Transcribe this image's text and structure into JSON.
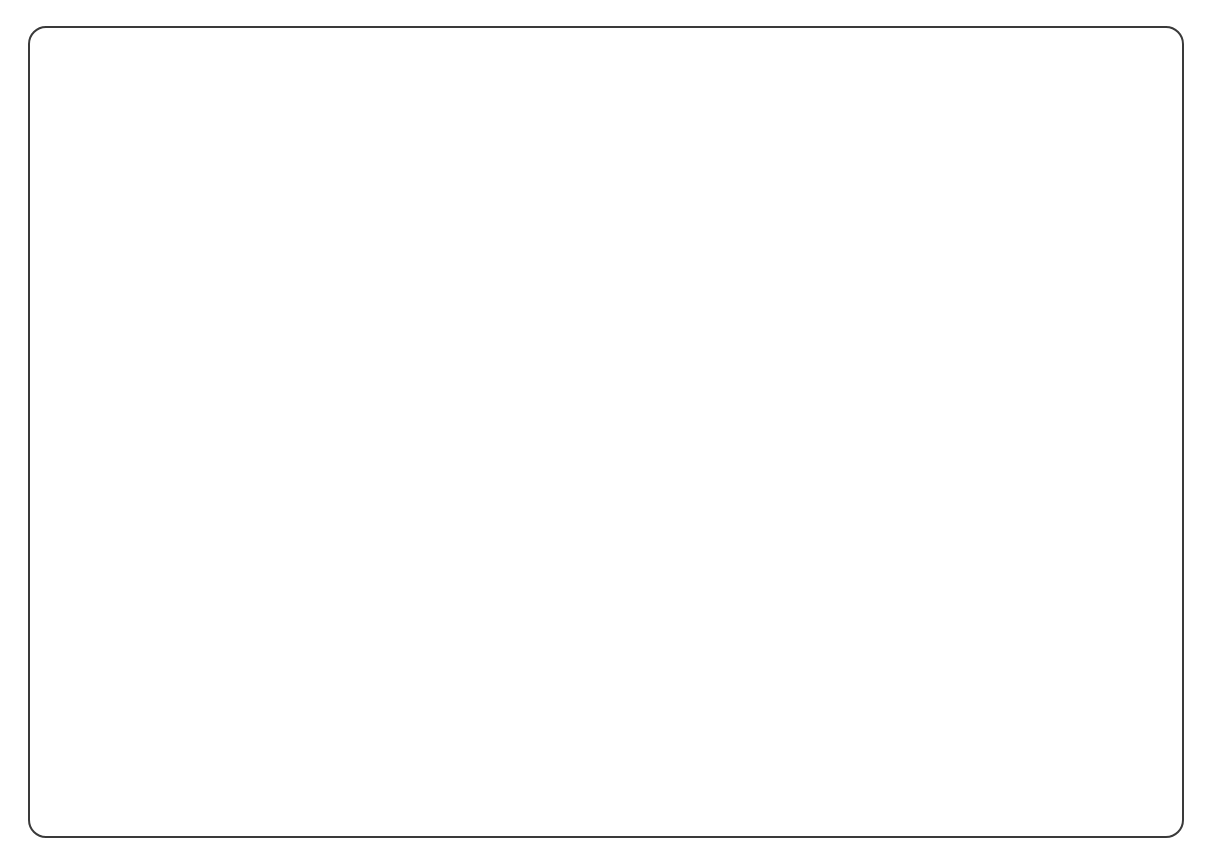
{
  "title": {
    "line1": "HOUSE VOTE ON PROHIBITION",
    "line2": "The 18th Amendment • 1917"
  },
  "legend": {
    "for_label": "States for prohibition",
    "against_label": "States against prohibition",
    "split_label": "States split",
    "colors": {
      "for": "#d2d1cb",
      "against": "#9b9b97",
      "split": "#c0bfba",
      "water": "#ffffff",
      "border": "#3a3a3a"
    }
  },
  "keys": {
    "for_prohibition_label": "For prohibition:",
    "for_prohibition_value": "2F",
    "against_prohibition_label": "Against prohibition:",
    "against_prohibition_value": "2A",
    "not_voting_label": "Not voting:",
    "not_voting_value": "2"
  },
  "totals": {
    "row_label": "Totals:",
    "headers": [
      "For",
      "Against",
      "Not Voting"
    ],
    "values": [
      "289",
      "134",
      "12"
    ]
  },
  "states": [
    {
      "id": "washington",
      "name": "WASHINGTON",
      "for": "5F",
      "against": "",
      "notvoting": "",
      "shade": "for"
    },
    {
      "id": "oregon",
      "name": "OREGON",
      "for": "2F",
      "against": "1A",
      "notvoting": "",
      "shade": "split"
    },
    {
      "id": "california",
      "name": "CALIFORNIA",
      "for": "5F",
      "against": "5A",
      "notvoting": "1",
      "shade": "split"
    },
    {
      "id": "nevada",
      "name": "NEVADA",
      "for": "",
      "against": "1A",
      "notvoting": "",
      "shade": "against"
    },
    {
      "id": "idaho",
      "name": "IDAHO",
      "for": "2F",
      "against": "",
      "notvoting": "",
      "shade": "for"
    },
    {
      "id": "montana",
      "name": "MONTANA",
      "for": "2F",
      "against": "",
      "notvoting": "",
      "shade": "for"
    },
    {
      "id": "wyoming",
      "name": "WYOMING",
      "for": "1F",
      "against": "",
      "notvoting": "",
      "shade": "for"
    },
    {
      "id": "utah",
      "name": "UTAH",
      "for": "2F",
      "against": "",
      "notvoting": "",
      "shade": "for"
    },
    {
      "id": "colorado",
      "name": "COLORADO",
      "for": "4F",
      "against": "",
      "notvoting": "",
      "shade": "for"
    },
    {
      "id": "arizona",
      "name": "ARIZONA",
      "for": "1F",
      "against": "",
      "notvoting": "",
      "shade": "for"
    },
    {
      "id": "new-mexico",
      "name": "NEW MEXICO",
      "for": "1F",
      "against": "",
      "notvoting": "",
      "shade": "for"
    },
    {
      "id": "north-dakota",
      "name": "NORTH DAKOTA",
      "for": "3F",
      "against": "",
      "notvoting": "",
      "shade": "for"
    },
    {
      "id": "south-dakota",
      "name": "SOUTH DAKOTA",
      "for": "3F",
      "against": "",
      "notvoting": "",
      "shade": "for"
    },
    {
      "id": "nebraska",
      "name": "NEBRASKA",
      "for": "6F",
      "against": "",
      "notvoting": "",
      "shade": "for"
    },
    {
      "id": "kansas",
      "name": "KANSAS",
      "for": "8F",
      "against": "",
      "notvoting": "",
      "shade": "for"
    },
    {
      "id": "oklahoma",
      "name": "OKLAHOMA",
      "for": "8F",
      "against": "",
      "notvoting": "",
      "shade": "for"
    },
    {
      "id": "texas",
      "name": "TEXAS",
      "for": "8F",
      "against": "8A",
      "notvoting": "2",
      "shade": "split"
    },
    {
      "id": "minnesota",
      "name": "MINN.",
      "for": "8F",
      "against": "2A",
      "notvoting": "",
      "shade": "split"
    },
    {
      "id": "iowa",
      "name": "IOWA",
      "for": "10F",
      "against": "1A",
      "notvoting": "",
      "shade": "split"
    },
    {
      "id": "missouri",
      "name": "MISSOURI",
      "for": "12F",
      "against": "3A",
      "notvoting": "1",
      "shade": "split"
    },
    {
      "id": "arkansas",
      "name": "ARKANSAS",
      "for": "7F",
      "against": "",
      "notvoting": "",
      "shade": "for"
    },
    {
      "id": "louisiana",
      "name": "LOUISIANA",
      "for": "4F",
      "against": "4A",
      "notvoting": "",
      "shade": "split"
    },
    {
      "id": "wisconsin",
      "name": "WISCONSIN",
      "for": "6F",
      "against": "5A",
      "notvoting": "",
      "shade": "split"
    },
    {
      "id": "illinois",
      "name": "ILLINOIS",
      "for": "17F",
      "against": "7A",
      "notvoting": "3",
      "shade": "split"
    },
    {
      "id": "michigan",
      "name": "MICHIGAN",
      "for": "11F",
      "against": "2A",
      "notvoting": "",
      "shade": "split"
    },
    {
      "id": "indiana",
      "name": "IND.",
      "for": "10F",
      "against": "",
      "notvoting": "",
      "shade": "for"
    },
    {
      "id": "ohio",
      "name": "OHIO",
      "for": "12F",
      "against": "8A",
      "notvoting": "2",
      "shade": "split"
    },
    {
      "id": "kentucky",
      "name": "KY.",
      "for": "8F",
      "against": "3A",
      "notvoting": "",
      "shade": "split"
    },
    {
      "id": "tennessee",
      "name": "TENNESSEE",
      "for": "10F",
      "against": "",
      "notvoting": "",
      "shade": "for"
    },
    {
      "id": "mississippi",
      "name": "MISS.",
      "for": "8F",
      "against": "",
      "notvoting": "",
      "shade": "for"
    },
    {
      "id": "alabama",
      "name": "ALABAMA",
      "for": "5F",
      "against": "5A",
      "notvoting": "",
      "shade": "split"
    },
    {
      "id": "georgia",
      "name": "GEORGIA",
      "for": "12F",
      "against": "",
      "notvoting": "",
      "shade": "for"
    },
    {
      "id": "florida",
      "name": "FLA.",
      "for": "4F",
      "against": "",
      "notvoting": "",
      "shade": "for"
    },
    {
      "id": "south-carolina",
      "name": "S. CAR.",
      "for": "6F",
      "against": "1A",
      "notvoting": "",
      "shade": "split"
    },
    {
      "id": "north-carolina",
      "name": "N. CAR.",
      "for": "8F",
      "against": "2A",
      "notvoting": "",
      "shade": "split"
    },
    {
      "id": "virginia",
      "name": "VIRGINIA",
      "for": "10F",
      "against": "",
      "notvoting": "",
      "shade": "for"
    },
    {
      "id": "west-virginia",
      "name": "W. VA.",
      "for": "6F",
      "against": "",
      "notvoting": "",
      "shade": "for"
    },
    {
      "id": "maryland",
      "name": "MD.",
      "for": "2F",
      "against": "4A",
      "notvoting": "",
      "shade": "split"
    },
    {
      "id": "delaware",
      "name": "DEL.",
      "for": "1F",
      "against": "",
      "notvoting": "",
      "shade": "for"
    },
    {
      "id": "pennsylvania",
      "name": "PENN.",
      "for": "18F",
      "against": "18A",
      "notvoting": "",
      "shade": "split"
    },
    {
      "id": "new-jersey",
      "name": "N.J.",
      "for": "2F",
      "against": "10A",
      "notvoting": "",
      "shade": "split"
    },
    {
      "id": "new-york",
      "name": "NEW YORK",
      "for": "14F",
      "against": "28A",
      "notvoting": "1",
      "shade": "split"
    },
    {
      "id": "connecticut",
      "name": "CONN.",
      "for": "",
      "against": "5A",
      "notvoting": "",
      "shade": "against"
    },
    {
      "id": "rhode-island",
      "name": "R.I.",
      "for": "1F",
      "against": "2A",
      "notvoting": "",
      "shade": "split"
    },
    {
      "id": "massachusetts",
      "name": "MASS.",
      "for": "6F",
      "against": "8A",
      "notvoting": "2",
      "shade": "split"
    },
    {
      "id": "vermont",
      "name": "VT.",
      "for": "1F",
      "against": "1A",
      "notvoting": "",
      "shade": "split"
    },
    {
      "id": "new-hampshire",
      "name": "N.H.",
      "for": "2F",
      "against": "",
      "notvoting": "",
      "shade": "for"
    },
    {
      "id": "maine",
      "name": "MAINE",
      "for": "4F",
      "against": "",
      "notvoting": "",
      "shade": "for"
    }
  ],
  "chart_data": {
    "type": "map",
    "title": "HOUSE VOTE ON PROHIBITION",
    "subtitle": "The 18th Amendment • 1917",
    "categories": [
      "For",
      "Against",
      "Not Voting"
    ],
    "values": [
      289,
      134,
      12
    ],
    "legend_position": "bottom-left",
    "note": "Choropleth of US states shaded by delegation vote: for / against / split"
  }
}
